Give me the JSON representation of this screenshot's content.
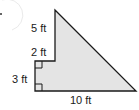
{
  "figure": {
    "shape": "composite-polygon",
    "fill_color": "#e4e4e4",
    "stroke_color": "#1a1a1a",
    "labels": {
      "top_left_vertical": "5 ft",
      "step_horizontal": "2 ft",
      "bottom_left_vertical": "3 ft",
      "base": "10 ft"
    },
    "right_angle_marks": 2
  }
}
